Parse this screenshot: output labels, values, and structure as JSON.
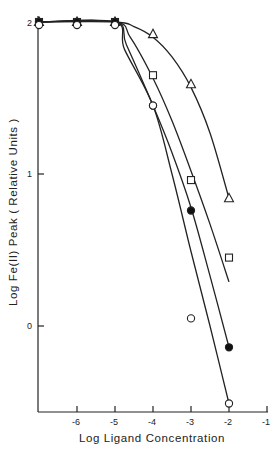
{
  "chart_data": {
    "type": "line",
    "title": "",
    "xlabel": "Log Ligand Concentration",
    "ylabel": "Log Fe(II) Peak (Relative Units)",
    "xlim": [
      -7,
      -1
    ],
    "ylim": [
      -0.6,
      2.05
    ],
    "grid": false,
    "legend": "none (markers only: triangle, square, filled circle, open circle)",
    "x_ticks": [
      -6,
      -5,
      -4,
      -3,
      -2,
      -1
    ],
    "x_tick_labels": [
      "-6",
      "-5",
      "-4",
      "-3",
      "-2",
      "-1"
    ],
    "y_ticks": [
      0,
      1,
      2
    ],
    "y_tick_labels": [
      "0",
      "1",
      "2"
    ],
    "series": [
      {
        "name": "open triangle",
        "marker": "triangle-open",
        "x": [
          -7,
          -6,
          -5,
          -4,
          -3,
          -2
        ],
        "y": [
          2.0,
          2.0,
          2.0,
          1.92,
          1.59,
          0.84
        ],
        "curve": [
          [
            -7,
            2.0
          ],
          [
            -5,
            2.0
          ],
          [
            -4.5,
            1.97
          ],
          [
            -4,
            1.9
          ],
          [
            -3.5,
            1.77
          ],
          [
            -3,
            1.57
          ],
          [
            -2.5,
            1.27
          ],
          [
            -2,
            0.84
          ]
        ]
      },
      {
        "name": "open square",
        "marker": "square-open",
        "x": [
          -7,
          -6,
          -5,
          -4,
          -3,
          -2
        ],
        "y": [
          2.0,
          2.0,
          2.0,
          1.65,
          0.96,
          0.45
        ],
        "curve": [
          [
            -7,
            2.0
          ],
          [
            -5,
            2.0
          ],
          [
            -4.6,
            1.9
          ],
          [
            -4,
            1.63
          ],
          [
            -3.5,
            1.35
          ],
          [
            -3,
            1.02
          ],
          [
            -2.5,
            0.67
          ],
          [
            -2,
            0.29
          ]
        ]
      },
      {
        "name": "filled circle",
        "marker": "circle-filled",
        "x": [
          -7,
          -6,
          -5,
          -4,
          -3,
          -2
        ],
        "y": [
          2.0,
          2.0,
          2.0,
          1.45,
          0.76,
          -0.14
        ],
        "curve": [
          [
            -7,
            2.0
          ],
          [
            -5,
            2.0
          ],
          [
            -4.7,
            1.85
          ],
          [
            -4,
            1.45
          ],
          [
            -3.5,
            1.14
          ],
          [
            -3,
            0.78
          ],
          [
            -2.5,
            0.33
          ],
          [
            -2,
            -0.14
          ]
        ]
      },
      {
        "name": "open circle",
        "marker": "circle-open",
        "x": [
          -7,
          -6,
          -5,
          -4,
          -3,
          -2
        ],
        "y": [
          1.98,
          1.98,
          1.98,
          1.45,
          0.05,
          -0.51
        ],
        "curve": [
          [
            -7,
            2.0
          ],
          [
            -5,
            2.0
          ],
          [
            -4.75,
            1.82
          ],
          [
            -4,
            1.45
          ],
          [
            -3.5,
            1.0
          ],
          [
            -3,
            0.49
          ],
          [
            -2.5,
            0.0
          ],
          [
            -2,
            -0.51
          ]
        ]
      }
    ]
  },
  "axes": {
    "x_title": "Log Ligand Concentration",
    "y_title": "Log Fe(II)  Peak ( Relative Units )",
    "x_tick_labels": [
      "-6",
      "-5",
      "-4",
      "-3",
      "-2",
      "-1"
    ],
    "y_tick_labels": [
      "0",
      "1",
      "2"
    ]
  }
}
